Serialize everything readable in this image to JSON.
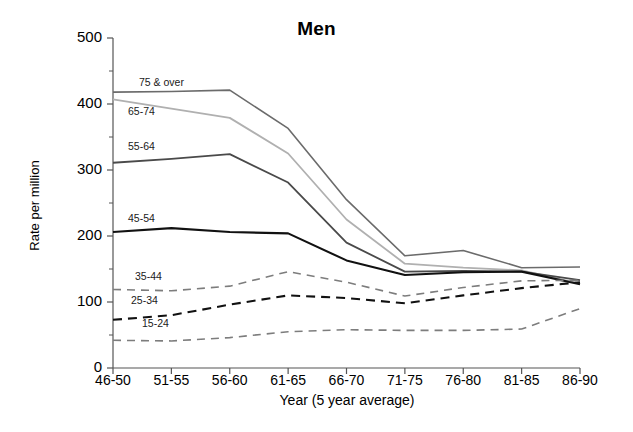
{
  "chart_data": {
    "type": "line",
    "title": "Men",
    "xlabel": "Year (5 year average)",
    "ylabel": "Rate per million",
    "categories": [
      "46-50",
      "51-55",
      "56-60",
      "61-65",
      "66-70",
      "71-75",
      "76-80",
      "81-85",
      "86-90"
    ],
    "ylim": [
      0,
      500
    ],
    "xlim_labels": [
      "46-50",
      "86-90"
    ],
    "yticks": [
      0,
      100,
      200,
      300,
      400,
      500
    ],
    "ytick_labels": [
      "0",
      "100",
      "200",
      "300",
      "400",
      "500"
    ],
    "yminor_ticks": [
      50,
      150,
      250,
      350,
      450
    ],
    "grid": false,
    "legend": "inline-labels",
    "series": [
      {
        "name": "75 & over",
        "label": "75 & over",
        "color": "#6b6b6b",
        "style": "solid",
        "width": 1.6,
        "values": [
          418,
          419,
          421,
          363,
          255,
          170,
          178,
          152,
          153
        ]
      },
      {
        "name": "65-74",
        "label": "65-74",
        "color": "#b0b0b0",
        "style": "solid",
        "width": 1.8,
        "values": [
          407,
          393,
          379,
          325,
          225,
          158,
          152,
          148,
          128
        ]
      },
      {
        "name": "55-64",
        "label": "55-64",
        "color": "#4a4a4a",
        "style": "solid",
        "width": 1.8,
        "values": [
          311,
          317,
          324,
          281,
          190,
          146,
          147,
          146,
          133
        ]
      },
      {
        "name": "45-54",
        "label": "45-54",
        "color": "#111111",
        "style": "solid",
        "width": 2.1,
        "values": [
          206,
          212,
          206,
          204,
          163,
          141,
          145,
          146,
          127
        ]
      },
      {
        "name": "35-44",
        "label": "35-44",
        "color": "#7d7d7d",
        "style": "dashed",
        "width": 1.6,
        "values": [
          119,
          117,
          124,
          146,
          130,
          109,
          122,
          132,
          133
        ]
      },
      {
        "name": "25-34",
        "label": "25-34",
        "color": "#111111",
        "style": "dashed",
        "width": 2.1,
        "values": [
          73,
          80,
          96,
          110,
          106,
          98,
          110,
          121,
          130
        ]
      },
      {
        "name": "15-24",
        "label": "15-24",
        "color": "#7d7d7d",
        "style": "dashed",
        "width": 1.6,
        "values": [
          42,
          41,
          46,
          55,
          58,
          57,
          57,
          59,
          90
        ]
      }
    ],
    "series_label_positions": [
      {
        "name": "75 & over",
        "x": 139,
        "y": 76
      },
      {
        "name": "65-74",
        "x": 128,
        "y": 105
      },
      {
        "name": "55-64",
        "x": 128,
        "y": 140
      },
      {
        "name": "45-54",
        "x": 128,
        "y": 212
      },
      {
        "name": "35-44",
        "x": 135,
        "y": 270
      },
      {
        "name": "25-34",
        "x": 131,
        "y": 294
      },
      {
        "name": "15-24",
        "x": 142,
        "y": 317
      }
    ],
    "axis_geometry": {
      "plot_left": 113,
      "plot_right": 580,
      "plot_top": 38,
      "plot_bottom": 368,
      "axis_color": "#555555"
    }
  }
}
